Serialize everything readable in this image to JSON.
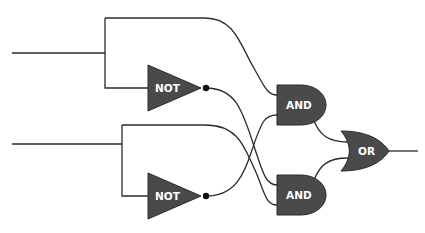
{
  "diagram": {
    "type": "logic-circuit",
    "gates": {
      "not_top": {
        "label": "NOT"
      },
      "not_bottom": {
        "label": "NOT"
      },
      "and_top": {
        "label": "AND"
      },
      "and_bottom": {
        "label": "AND"
      },
      "or": {
        "label": "OR"
      }
    },
    "colors": {
      "gate_fill": "#4a4a4a",
      "wire": "#2b2b2b",
      "label": "#ffffff",
      "background": "#ffffff"
    }
  }
}
